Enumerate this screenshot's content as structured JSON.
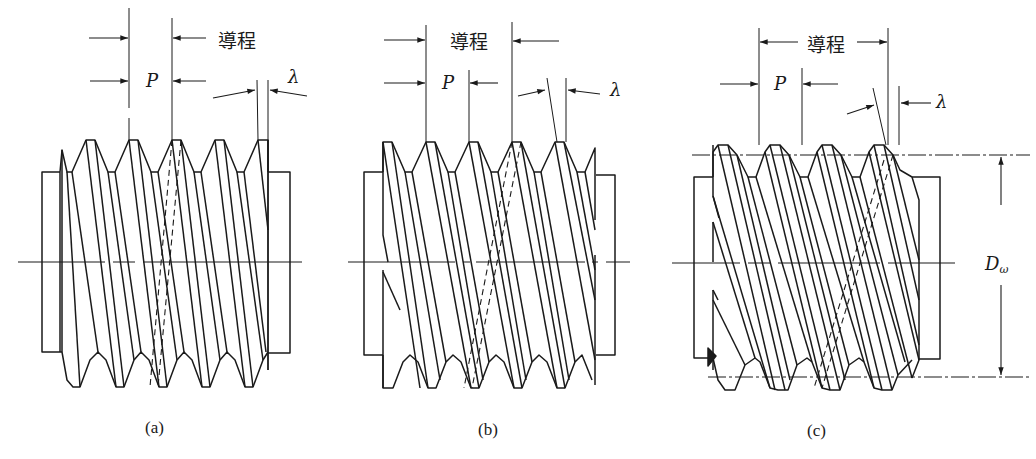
{
  "figure": {
    "panels": [
      {
        "id": "a",
        "caption": "(a)",
        "lead_label": "導程",
        "pitch_label": "P",
        "lead_angle_label": "λ",
        "description": "Single-start worm thread: lead equals pitch"
      },
      {
        "id": "b",
        "caption": "(b)",
        "lead_label": "導程",
        "pitch_label": "P",
        "lead_angle_label": "λ",
        "description": "Double-start worm thread: lead equals 2 × pitch"
      },
      {
        "id": "c",
        "caption": "(c)",
        "lead_label": "導程",
        "pitch_label": "P",
        "lead_angle_label": "λ",
        "diameter_label": "D",
        "diameter_subscript": "ω",
        "description": "Triple-start worm thread: lead equals 3 × pitch"
      }
    ],
    "colors": {
      "line": "#1a1a1a",
      "background": "#ffffff"
    }
  }
}
